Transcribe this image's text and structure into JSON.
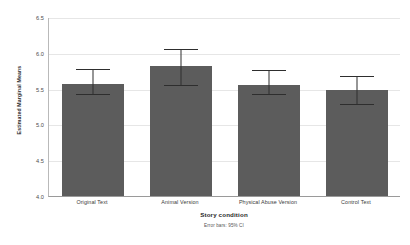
{
  "chart_data": {
    "type": "bar",
    "title": "",
    "subtitle": "",
    "xlabel": "Story condition",
    "ylabel": "Estimated Marginal Means",
    "categories": [
      "Original Text",
      "Animal Version",
      "Physical Abuse Version",
      "Control Text"
    ],
    "values": [
      5.57,
      5.82,
      5.55,
      5.48
    ],
    "error_bars": {
      "type": "95% CI",
      "lower": [
        5.43,
        5.55,
        5.42,
        5.29
      ],
      "upper": [
        5.79,
        6.07,
        5.77,
        5.69
      ]
    },
    "ylim": [
      4.0,
      6.5
    ],
    "yticks": [
      "4.0",
      "4.5",
      "5.0",
      "5.5",
      "6.0",
      "6.5"
    ],
    "ytick_values": [
      4.0,
      4.5,
      5.0,
      5.5,
      6.0,
      6.5
    ],
    "grid": true,
    "legend": "none",
    "annotation": "Error bars: 95% CI",
    "bar_color": "#5c5c5c",
    "error_color": "#2e2e2e",
    "grid_color": "#e6e6e6",
    "axis_color": "#9a9a9a",
    "background": "#ffffff"
  }
}
